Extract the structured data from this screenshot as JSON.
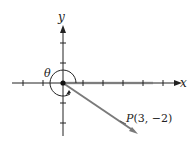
{
  "diagram": {
    "type": "coordinate-plane-angle",
    "axes": {
      "x_label": "x",
      "y_label": "y"
    },
    "angle_label": "θ",
    "point": {
      "label_name": "P",
      "label_coords": "(3, −2)",
      "x": 3,
      "y": -2
    },
    "colors": {
      "axis": "#222222",
      "vector": "#7a7a7a",
      "highlight": "#d8d8d8"
    }
  }
}
